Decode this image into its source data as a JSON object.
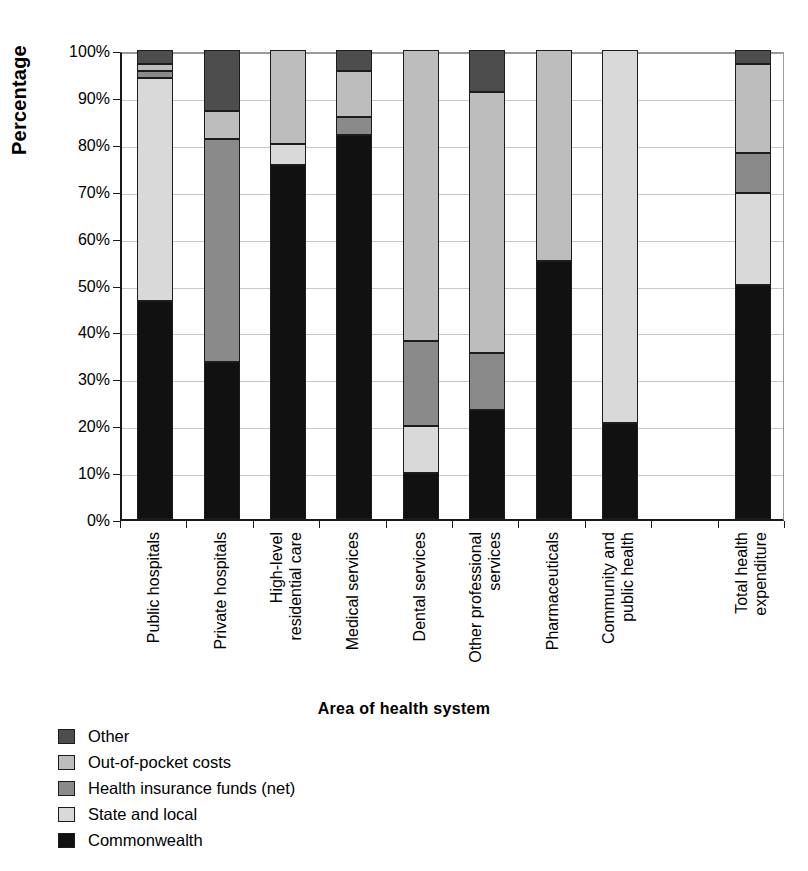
{
  "chart_data": {
    "type": "bar",
    "subtype": "stacked-percentage",
    "title": "",
    "xlabel": "Area of health system",
    "ylabel": "Percentage",
    "ylim": [
      0,
      100
    ],
    "ytick_labels": [
      "0%",
      "10%",
      "20%",
      "30%",
      "40%",
      "50%",
      "60%",
      "70%",
      "80%",
      "90%",
      "100%"
    ],
    "ytick_values": [
      0,
      10,
      20,
      30,
      40,
      50,
      60,
      70,
      80,
      90,
      100
    ],
    "grid": true,
    "legend_position": "below-left",
    "categories": [
      "Public hospitals",
      "Private hospitals",
      "High-level residential care",
      "Medical services",
      "Dental services",
      "Other professional services",
      "Pharmaceuticals",
      "Community and public health",
      "",
      "Total health expenditure"
    ],
    "category_lines": [
      [
        "Public hospitals"
      ],
      [
        "Private hospitals"
      ],
      [
        "High-level",
        "residential care"
      ],
      [
        "Medical services"
      ],
      [
        "Dental services"
      ],
      [
        "Other professional",
        "services"
      ],
      [
        "Pharmaceuticals"
      ],
      [
        "Community and",
        "public health"
      ],
      [
        ""
      ],
      [
        "Total health",
        "expenditure"
      ]
    ],
    "series": [
      {
        "name": "Commonwealth",
        "color": "#111111",
        "values": [
          46.5,
          33.5,
          75.5,
          81.8,
          9.8,
          23.3,
          55.0,
          20.5,
          null,
          50.0
        ]
      },
      {
        "name": "State and local",
        "color": "#d9d9d9",
        "values": [
          47.5,
          0.0,
          4.5,
          0.0,
          10.0,
          0.0,
          0.0,
          79.5,
          null,
          19.5
        ]
      },
      {
        "name": "Health insurance funds (net)",
        "color": "#8a8a8a",
        "values": [
          1.5,
          47.5,
          0.0,
          3.9,
          18.2,
          12.2,
          0.0,
          0.0,
          null,
          8.5
        ]
      },
      {
        "name": "Out-of-pocket costs",
        "color": "#bdbdbd",
        "values": [
          1.5,
          6.0,
          20.0,
          9.8,
          62.0,
          55.5,
          45.0,
          0.0,
          null,
          19.0
        ]
      },
      {
        "name": "Other",
        "color": "#4d4d4d",
        "values": [
          3.0,
          13.0,
          0.0,
          4.5,
          0.0,
          9.0,
          0.0,
          0.0,
          null,
          3.0
        ]
      }
    ],
    "legend": [
      {
        "label": "Other",
        "color": "#4d4d4d"
      },
      {
        "label": "Out-of-pocket costs",
        "color": "#bdbdbd"
      },
      {
        "label": "Health insurance funds (net)",
        "color": "#8a8a8a"
      },
      {
        "label": "State and local",
        "color": "#d9d9d9"
      },
      {
        "label": "Commonwealth",
        "color": "#111111"
      }
    ]
  }
}
